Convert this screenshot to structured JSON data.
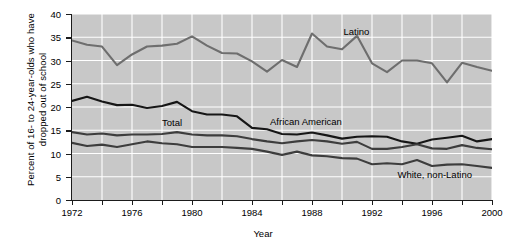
{
  "chart_data": {
    "type": "line",
    "title": "",
    "xlabel": "Year",
    "ylabel": "Percent of 16- to 24-year-olds who have dropped out of school",
    "xlim": [
      1972,
      2000
    ],
    "ylim": [
      0,
      40
    ],
    "grid": true,
    "legend_position": "inline-labels",
    "x": [
      1972,
      1973,
      1974,
      1975,
      1976,
      1977,
      1978,
      1979,
      1980,
      1981,
      1982,
      1983,
      1984,
      1985,
      1986,
      1987,
      1988,
      1989,
      1990,
      1991,
      1992,
      1993,
      1994,
      1995,
      1996,
      1997,
      1998,
      1999,
      2000
    ],
    "xtick_values": [
      1972,
      1974,
      1976,
      1978,
      1980,
      1982,
      1984,
      1986,
      1988,
      1990,
      1992,
      1994,
      1996,
      1998,
      2000
    ],
    "xtick_labels": [
      "1972",
      "",
      "1976",
      "",
      "1980",
      "",
      "1984",
      "",
      "1988",
      "",
      "1992",
      "",
      "1996",
      "",
      "2000"
    ],
    "ytick_values": [
      0,
      5,
      10,
      15,
      20,
      25,
      30,
      35,
      40
    ],
    "ytick_labels": [
      "0",
      "5",
      "10",
      "15",
      "20",
      "25",
      "30",
      "35",
      "40"
    ],
    "series": [
      {
        "name": "Latino",
        "color": "#6e6e6e",
        "label_x": 1990.1,
        "label_y": 36.0,
        "values": [
          34.3,
          33.4,
          33.0,
          29.0,
          31.3,
          33.0,
          33.2,
          33.6,
          35.2,
          33.2,
          31.6,
          31.5,
          29.8,
          27.6,
          30.1,
          28.6,
          35.8,
          33.0,
          32.4,
          35.3,
          29.4,
          27.5,
          30.0,
          30.0,
          29.4,
          25.3,
          29.5,
          28.6,
          27.8
        ]
      },
      {
        "name": "African American",
        "color": "#161616",
        "label_x": 1985.2,
        "label_y": 16.6,
        "values": [
          21.3,
          22.2,
          21.2,
          20.4,
          20.5,
          19.8,
          20.2,
          21.1,
          19.1,
          18.4,
          18.4,
          18.0,
          15.5,
          15.2,
          14.2,
          14.1,
          14.5,
          13.9,
          13.2,
          13.6,
          13.7,
          13.6,
          12.6,
          12.1,
          13.0,
          13.4,
          13.8,
          12.6,
          13.1
        ]
      },
      {
        "name": "Total",
        "color": "#3d3d3d",
        "label_x": 1978.0,
        "label_y": 16.4,
        "values": [
          14.6,
          14.1,
          14.3,
          13.9,
          14.1,
          14.1,
          14.2,
          14.6,
          14.1,
          13.9,
          13.9,
          13.7,
          13.1,
          12.6,
          12.2,
          12.6,
          12.9,
          12.6,
          12.1,
          12.5,
          11.0,
          11.0,
          11.4,
          12.0,
          11.1,
          11.0,
          11.8,
          11.2,
          10.9
        ]
      },
      {
        "name": "White, non-Latino",
        "color": "#3d3d3d",
        "label_x": 1993.7,
        "label_y": 5.2,
        "values": [
          12.3,
          11.6,
          11.9,
          11.4,
          12.0,
          12.6,
          12.2,
          12.0,
          11.4,
          11.4,
          11.4,
          11.2,
          11.0,
          10.4,
          9.7,
          10.4,
          9.6,
          9.4,
          9.0,
          8.9,
          7.7,
          7.9,
          7.7,
          8.6,
          7.3,
          7.6,
          7.7,
          7.3,
          6.9
        ]
      }
    ]
  }
}
